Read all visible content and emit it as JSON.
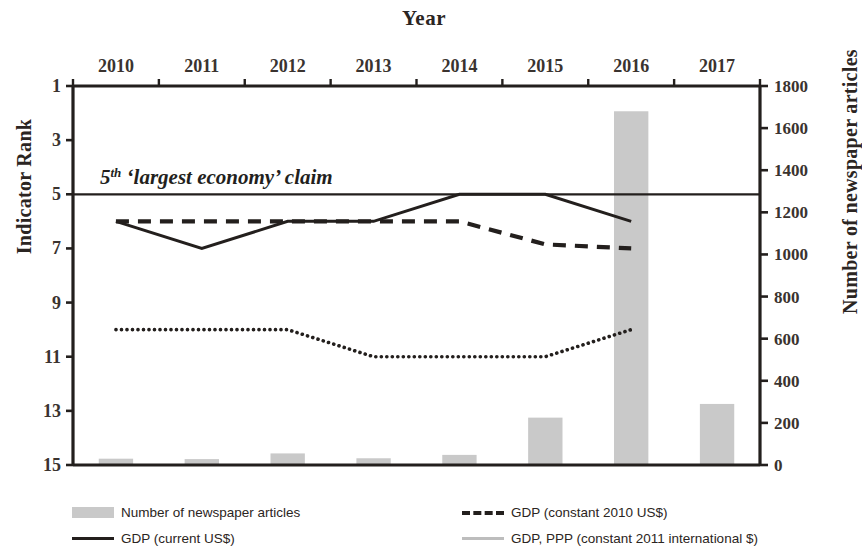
{
  "chart_data": {
    "type": "bar",
    "title": "Year",
    "xlabel": "Year",
    "ylabel": "Indicator Rank",
    "ylabel_secondary": "Number of newspaper articles",
    "categories": [
      "2010",
      "2011",
      "2012",
      "2013",
      "2014",
      "2015",
      "2016",
      "2017"
    ],
    "yticks_left": [
      1,
      3,
      5,
      7,
      9,
      11,
      13,
      15
    ],
    "ylim_left": [
      1,
      15
    ],
    "left_axis_inverted": true,
    "yticks_right": [
      0,
      200,
      400,
      600,
      800,
      1000,
      1200,
      1400,
      1600,
      1800
    ],
    "ylim_right": [
      0,
      1800
    ],
    "grid": false,
    "legend_position": "bottom",
    "annotation": {
      "text_prefix": "5",
      "text_superscript": "th",
      "text_rest": " ‘largest economy’ claim",
      "full_text": "5th ‘largest economy’ claim",
      "rank_value": 5
    },
    "series": [
      {
        "name": "Number of newspaper articles",
        "type": "bar",
        "axis": "right",
        "color": "#c9c9c9",
        "values": [
          30,
          28,
          55,
          32,
          48,
          225,
          1680,
          290
        ]
      },
      {
        "name": "GDP (current US$)",
        "type": "line",
        "style": "solid",
        "axis": "left",
        "color": "#231f1d",
        "values": [
          6,
          7,
          6,
          6,
          5,
          5,
          6,
          null
        ]
      },
      {
        "name": "GDP (constant 2010 US$)",
        "type": "line",
        "style": "dashed",
        "axis": "left",
        "color": "#231f1d",
        "values": [
          6,
          6,
          6,
          6,
          6,
          6.85,
          7,
          null
        ]
      },
      {
        "name": "GDP, PPP (constant 2011 international $)",
        "type": "line",
        "style": "dotted",
        "axis": "left",
        "color": "#231f1d",
        "values": [
          10,
          10,
          10,
          11,
          11,
          11,
          10,
          null
        ]
      }
    ]
  },
  "legend": {
    "items": [
      {
        "label": "Number of newspaper articles",
        "marker": "bar-swatch-icon"
      },
      {
        "label": "GDP (current US$)",
        "marker": "solid-line-icon"
      },
      {
        "label": "GDP (constant 2010 US$)",
        "marker": "dashed-line-icon"
      },
      {
        "label": "GDP, PPP (constant 2011 international $)",
        "marker": "dotted-line-icon"
      }
    ]
  }
}
